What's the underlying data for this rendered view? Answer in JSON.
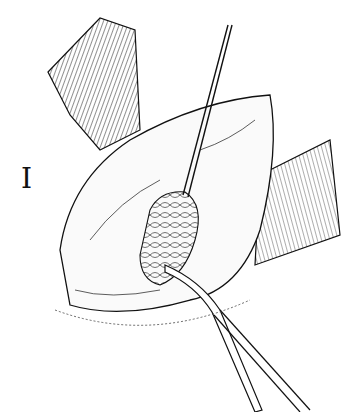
{
  "figure": {
    "panel_label": "I",
    "colors": {
      "ink": "#111111",
      "background": "#ffffff"
    }
  }
}
